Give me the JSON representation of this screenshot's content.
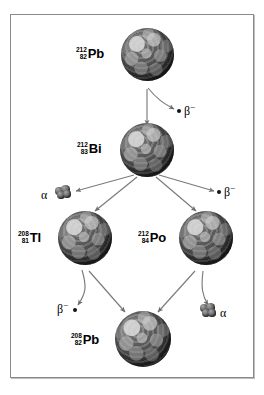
{
  "figure": {
    "background_color": "#ffffff",
    "frame_color": "#8a8a8a"
  },
  "nuclides": [
    {
      "id": "pb-212",
      "mass_number": "212",
      "atomic_number": "82",
      "symbol": "Pb",
      "name": "lead-212"
    },
    {
      "id": "bi-212",
      "mass_number": "212",
      "atomic_number": "83",
      "symbol": "Bi",
      "name": "bismuth-212"
    },
    {
      "id": "tl-208",
      "mass_number": "208",
      "atomic_number": "81",
      "symbol": "Tl",
      "name": "thallium-208"
    },
    {
      "id": "po-212",
      "mass_number": "212",
      "atomic_number": "84",
      "symbol": "Po",
      "name": "polonium-212"
    },
    {
      "id": "pb-208",
      "mass_number": "208",
      "atomic_number": "82",
      "symbol": "Pb",
      "name": "lead-208"
    }
  ],
  "particles": [
    {
      "id": "beta-1",
      "symbol": "β",
      "charge": "−",
      "kind": "beta-minus",
      "marker": "dot",
      "marker_side": "left"
    },
    {
      "id": "alpha-1",
      "symbol": "α",
      "charge": "",
      "kind": "alpha",
      "marker": "cluster",
      "marker_side": "right"
    },
    {
      "id": "beta-2",
      "symbol": "β",
      "charge": "−",
      "kind": "beta-minus",
      "marker": "dot",
      "marker_side": "left"
    },
    {
      "id": "beta-3",
      "symbol": "β",
      "charge": "−",
      "kind": "beta-minus",
      "marker": "dot",
      "marker_side": "right"
    },
    {
      "id": "alpha-2",
      "symbol": "α",
      "charge": "",
      "kind": "alpha",
      "marker": "cluster",
      "marker_side": "left"
    }
  ],
  "decays": [
    {
      "from": "pb-212",
      "to": "bi-212",
      "emits": "beta-1"
    },
    {
      "from": "bi-212",
      "to": "tl-208",
      "emits": "alpha-1"
    },
    {
      "from": "bi-212",
      "to": "po-212",
      "emits": "beta-3"
    },
    {
      "from": "tl-208",
      "to": "pb-208",
      "emits": "beta-2"
    },
    {
      "from": "po-212",
      "to": "pb-208",
      "emits": "alpha-2"
    }
  ]
}
